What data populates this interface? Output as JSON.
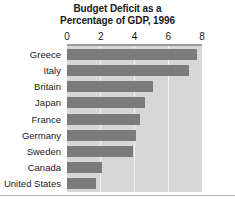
{
  "chart_data": {
    "type": "bar",
    "orientation": "horizontal",
    "title": "Budget Deficit as a Percentage of GDP, 1996",
    "title_lines": [
      "Budget Deficit as a",
      "Percentage of GDP, 1996"
    ],
    "xlabel": "",
    "ylabel": "",
    "categories": [
      "Greece",
      "Italy",
      "Britain",
      "Japan",
      "France",
      "Germany",
      "Sweden",
      "Canada",
      "United States"
    ],
    "values": [
      7.7,
      7.2,
      5.1,
      4.6,
      4.3,
      4.1,
      3.9,
      2.1,
      1.7
    ],
    "xlim": [
      0,
      8
    ],
    "xticks": [
      0,
      2,
      4,
      6,
      8
    ],
    "xtick_labels": [
      "0",
      "2",
      "4",
      "6",
      "8"
    ],
    "grid": true,
    "grid_axis": "x",
    "legend": false,
    "colors": {
      "bar": "#7b7b7b",
      "plot_background": "#d7d7d7",
      "gridline": "#f0f0f0",
      "axis_rule": "#9a9a9a",
      "text": "#1a1a1a",
      "figure_background": "#ffffff"
    }
  }
}
